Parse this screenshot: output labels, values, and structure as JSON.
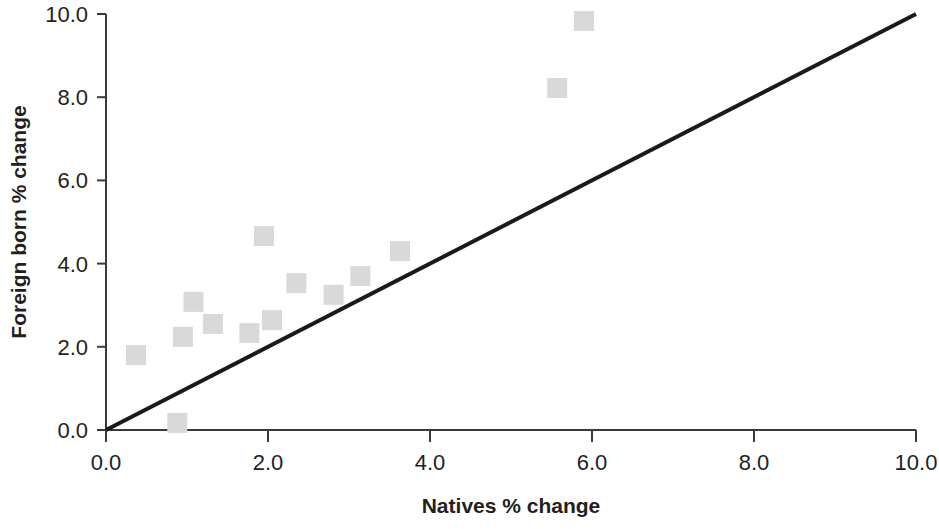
{
  "chart_data": {
    "type": "scatter",
    "title": "",
    "xlabel": "Natives % change",
    "ylabel": "Foreign born % change",
    "xlim": [
      0.0,
      10.0
    ],
    "ylim": [
      0.0,
      10.0
    ],
    "xticks": [
      "0.0",
      "2.0",
      "4.0",
      "6.0",
      "8.0",
      "10.0"
    ],
    "xtick_values": [
      0.0,
      2.0,
      4.0,
      6.0,
      8.0,
      10.0
    ],
    "yticks": [
      "0.0",
      "2.0",
      "4.0",
      "6.0",
      "8.0",
      "10.0"
    ],
    "ytick_values": [
      0.0,
      2.0,
      4.0,
      6.0,
      8.0,
      10.0
    ],
    "grid": false,
    "legend": null,
    "marker_shape": "square",
    "marker_color": "#d9d9d9",
    "marker_size": 20,
    "points": [
      {
        "x": 0.37,
        "y": 1.8
      },
      {
        "x": 0.88,
        "y": 0.17
      },
      {
        "x": 0.95,
        "y": 2.24
      },
      {
        "x": 1.08,
        "y": 3.08
      },
      {
        "x": 1.32,
        "y": 2.55
      },
      {
        "x": 1.77,
        "y": 2.33
      },
      {
        "x": 1.95,
        "y": 4.66
      },
      {
        "x": 2.05,
        "y": 2.64
      },
      {
        "x": 2.35,
        "y": 3.53
      },
      {
        "x": 2.81,
        "y": 3.25
      },
      {
        "x": 3.14,
        "y": 3.7
      },
      {
        "x": 3.63,
        "y": 4.3
      },
      {
        "x": 5.57,
        "y": 8.22
      },
      {
        "x": 5.9,
        "y": 9.83
      }
    ],
    "reference_line": {
      "description": "45-degree equality line",
      "color": "#1a1a1a",
      "from": {
        "x": 0.0,
        "y": 0.0
      },
      "to": {
        "x": 10.0,
        "y": 10.0
      }
    }
  },
  "axes": {
    "x_title": "Natives % change",
    "y_title": "Foreign born % change"
  }
}
